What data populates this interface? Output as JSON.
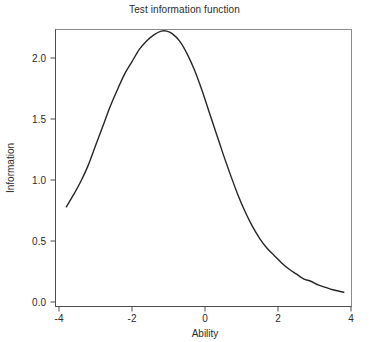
{
  "chart_data": {
    "type": "line",
    "title": "Test information function",
    "xlabel": "Ability",
    "ylabel": "Information",
    "xlim": [
      -4,
      4
    ],
    "ylim": [
      0.0,
      2.25
    ],
    "grid": false,
    "legend": null,
    "xticks": [
      -4,
      -2,
      0,
      2,
      4
    ],
    "xtick_labels": [
      "-4",
      "-2",
      "0",
      "2",
      "4"
    ],
    "yticks": [
      0.0,
      0.5,
      1.0,
      1.5,
      2.0
    ],
    "ytick_labels": [
      "0.0",
      "0.5",
      "1.0",
      "1.5",
      "2.0"
    ],
    "line_color": "#262626",
    "line_width": 1.4,
    "series": [
      {
        "name": "Test information",
        "x": [
          -3.8,
          -3.6,
          -3.4,
          -3.2,
          -3.0,
          -2.8,
          -2.6,
          -2.4,
          -2.2,
          -2.0,
          -1.8,
          -1.6,
          -1.4,
          -1.2,
          -1.05,
          -0.9,
          -0.7,
          -0.5,
          -0.3,
          -0.1,
          0.1,
          0.3,
          0.5,
          0.7,
          0.9,
          1.1,
          1.3,
          1.5,
          1.7,
          1.9,
          2.1,
          2.3,
          2.5,
          2.7,
          2.9,
          3.1,
          3.3,
          3.5,
          3.8
        ],
        "y": [
          0.78,
          0.88,
          0.99,
          1.12,
          1.28,
          1.44,
          1.6,
          1.74,
          1.87,
          1.97,
          2.07,
          2.14,
          2.19,
          2.22,
          2.22,
          2.2,
          2.14,
          2.04,
          1.91,
          1.75,
          1.57,
          1.39,
          1.21,
          1.04,
          0.88,
          0.74,
          0.62,
          0.52,
          0.44,
          0.38,
          0.32,
          0.27,
          0.23,
          0.19,
          0.17,
          0.14,
          0.12,
          0.1,
          0.08
        ]
      }
    ],
    "annotations": {
      "peak_x": -1.05,
      "peak_y": 2.22
    }
  },
  "title": {
    "text": "Test information function"
  },
  "axes": {
    "x_label": "Ability",
    "y_label": "Information"
  }
}
